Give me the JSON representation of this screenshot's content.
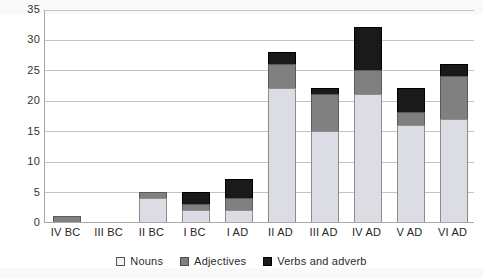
{
  "chart_data": {
    "type": "bar",
    "subtype": "stacked-vertical",
    "title": "",
    "subtitle": "",
    "xlabel": "",
    "ylabel": "",
    "categories": [
      "IV BC",
      "III BC",
      "II BC",
      "I BC",
      "I AD",
      "II AD",
      "III AD",
      "IV AD",
      "V AD",
      "VI AD"
    ],
    "series": [
      {
        "name": "Nouns",
        "color": "#dcdce4",
        "values": [
          0,
          0,
          4,
          2,
          2,
          22,
          15,
          21,
          16,
          17
        ]
      },
      {
        "name": "Adjectives",
        "color": "#808080",
        "values": [
          1,
          0,
          1,
          1,
          2,
          4,
          6,
          4,
          2,
          7
        ]
      },
      {
        "name": "Verbs and adverb",
        "color": "#1a1a1a",
        "values": [
          0,
          0,
          0,
          2,
          3,
          2,
          1,
          7,
          4,
          2
        ]
      }
    ],
    "totals": [
      1,
      0,
      5,
      5,
      7,
      28,
      22,
      32,
      22,
      26
    ],
    "ylim": [
      0,
      35
    ],
    "ytick_step": 5,
    "yticks": [
      "0",
      "5",
      "10",
      "15",
      "20",
      "25",
      "30",
      "35"
    ],
    "grid": "horizontal",
    "legend_position": "bottom-center"
  },
  "legend": {
    "items": [
      {
        "label": "Nouns",
        "swatch": "nouns-swatch-icon"
      },
      {
        "label": "Adjectives",
        "swatch": "adjectives-swatch-icon"
      },
      {
        "label": "Verbs and adverb",
        "swatch": "verbs-swatch-icon"
      }
    ]
  },
  "colors": {
    "nouns": "#dcdce4",
    "adjectives": "#808080",
    "verbs": "#1a1a1a",
    "gridline": "#c3c3c3",
    "axis": "#a8a8a8",
    "text": "#2b2b2b",
    "background": "#ffffff"
  }
}
